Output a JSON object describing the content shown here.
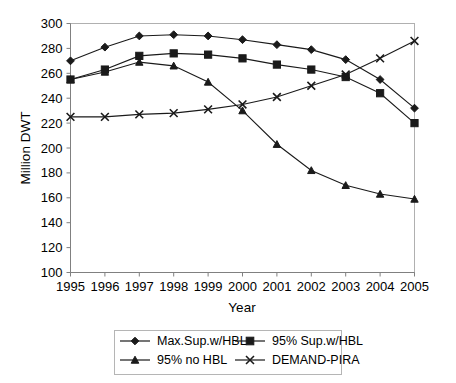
{
  "chart_data": {
    "type": "line",
    "title": "",
    "xlabel": "Year",
    "ylabel": "Million DWT",
    "categories": [
      "1995",
      "1996",
      "1997",
      "1998",
      "1999",
      "2000",
      "2001",
      "2002",
      "2003",
      "2004",
      "2005"
    ],
    "x": [
      1995,
      1996,
      1997,
      1998,
      1999,
      2000,
      2001,
      2002,
      2003,
      2004,
      2005
    ],
    "ylim": [
      100,
      300
    ],
    "xlim": [
      1995,
      2005
    ],
    "yticks": [
      100,
      120,
      140,
      160,
      180,
      200,
      220,
      240,
      260,
      280,
      300
    ],
    "ytick_labels": [
      "100",
      "120",
      "140",
      "160",
      "180",
      "200",
      "220",
      "240",
      "260",
      "280",
      "300"
    ],
    "grid": false,
    "legend_position": "bottom",
    "series": [
      {
        "name": "Max.Sup.w/HBL",
        "marker": "diamond",
        "values": [
          270,
          281,
          290,
          291,
          290,
          287,
          283,
          279,
          271,
          255,
          232
        ]
      },
      {
        "name": "95% Sup.w/HBL",
        "marker": "square",
        "values": [
          255,
          263,
          274,
          276,
          275,
          272,
          267,
          263,
          257,
          244,
          220
        ]
      },
      {
        "name": "95% no HBL",
        "marker": "triangle",
        "values": [
          255,
          261,
          269,
          266,
          253,
          230,
          203,
          182,
          170,
          163,
          159
        ]
      },
      {
        "name": "DEMAND-PIRA",
        "marker": "x",
        "values": [
          225,
          225,
          227,
          228,
          231,
          235,
          241,
          250,
          259,
          272,
          286
        ]
      }
    ]
  },
  "legend": {
    "entries": [
      {
        "label": "Max.Sup.w/HBL",
        "marker": "diamond"
      },
      {
        "label": "95% Sup.w/HBL",
        "marker": "square"
      },
      {
        "label": "95% no HBL",
        "marker": "triangle"
      },
      {
        "label": "DEMAND-PIRA",
        "marker": "x"
      }
    ]
  },
  "axes": {
    "y_title": "Million DWT",
    "x_title": "Year"
  }
}
